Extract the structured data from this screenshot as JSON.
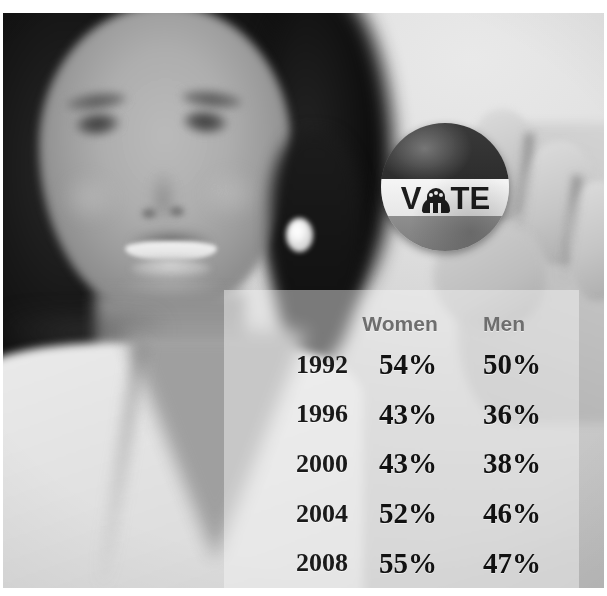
{
  "image": {
    "type": "photograph-with-data-overlay",
    "treatment": "grayscale",
    "subject": "smiling woman holding a VOTE campaign button",
    "width": 607,
    "height": 596
  },
  "vote_button": {
    "wordmark": "VOTE",
    "letters": [
      "V",
      "T",
      "E"
    ],
    "emblem_name": "capitol-dome-icon",
    "bands": [
      "dark-top",
      "white-middle",
      "gray-bottom"
    ],
    "colors": {
      "band_top": "#323232",
      "band_mid": "#ededed",
      "band_bottom": "#868686",
      "wordmark_ink": "#1d1d1d"
    }
  },
  "table": {
    "headers": [
      "",
      "Women",
      "Men"
    ],
    "year_header": "",
    "rows": [
      {
        "year": "1992",
        "women": "54%",
        "men": "50%"
      },
      {
        "year": "1996",
        "women": "43%",
        "men": "36%"
      },
      {
        "year": "2000",
        "women": "43%",
        "men": "38%"
      },
      {
        "year": "2004",
        "women": "52%",
        "men": "46%"
      },
      {
        "year": "2008",
        "women": "55%",
        "men": "47%"
      }
    ],
    "colors": {
      "header_text": "#6e6e6e",
      "year_text": "#1a1a1a",
      "value_text": "#111111",
      "panel_wash": "rgba(246,246,246,0.46)"
    }
  },
  "chart_data": {
    "type": "table",
    "title": "",
    "xlabel": "",
    "ylabel": "",
    "categories": [
      "1992",
      "1996",
      "2000",
      "2004",
      "2008"
    ],
    "series": [
      {
        "name": "Women",
        "values": [
          54,
          43,
          43,
          52,
          55
        ]
      },
      {
        "name": "Men",
        "values": [
          50,
          36,
          38,
          46,
          47
        ]
      }
    ],
    "value_suffix": "%",
    "ylim": [
      0,
      100
    ],
    "grid": false,
    "legend_position": "column-headers"
  }
}
